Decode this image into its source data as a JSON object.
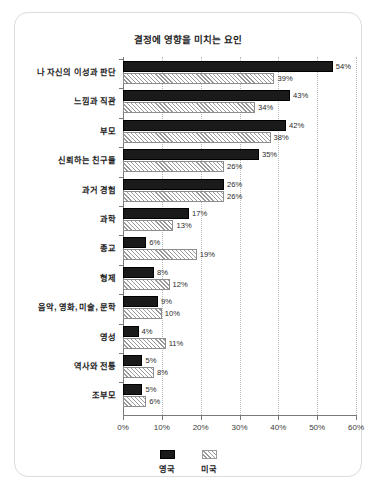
{
  "card": {
    "background_color": "#ffffff",
    "border_color": "#dcdcdc"
  },
  "chart_data": {
    "type": "bar",
    "orientation": "horizontal",
    "title": "결정에 영향을 미치는 요인",
    "xlabel": "",
    "ylabel": "",
    "xlim": [
      0,
      60
    ],
    "xticks": [
      0,
      10,
      20,
      30,
      40,
      50,
      60
    ],
    "xtick_labels": [
      "0%",
      "10%",
      "20%",
      "30%",
      "40%",
      "50%",
      "60%"
    ],
    "grid": true,
    "grid_style": "dotted-vertical",
    "legend_position": "bottom-center",
    "value_label_suffix": "%",
    "categories": [
      "나 자신의 이성과 판단",
      "느낌과 직관",
      "부모",
      "신뢰하는 친구들",
      "과거 경험",
      "과학",
      "종교",
      "형제",
      "음악, 영화, 미술, 문학",
      "영성",
      "역사와 전통",
      "조부모"
    ],
    "series": [
      {
        "name": "영국",
        "color": "#1a1a1a",
        "pattern": "solid",
        "values": [
          54,
          43,
          42,
          35,
          26,
          17,
          6,
          8,
          9,
          4,
          5,
          5
        ],
        "value_labels": [
          "54%",
          "43%",
          "42%",
          "35%",
          "26%",
          "17%",
          "6%",
          "8%",
          "9%",
          "4%",
          "5%",
          "5%"
        ]
      },
      {
        "name": "미국",
        "color": "#ffffff",
        "pattern": "diagonal-hatch",
        "values": [
          39,
          34,
          38,
          26,
          26,
          13,
          19,
          12,
          10,
          11,
          8,
          6
        ],
        "value_labels": [
          "39%",
          "34%",
          "38%",
          "26%",
          "26%",
          "13%",
          "19%",
          "12%",
          "10%",
          "11%",
          "8%",
          "6%"
        ]
      }
    ]
  },
  "legend": {
    "items": [
      {
        "label": "영국",
        "swatch": "solid-black-swatch"
      },
      {
        "label": "미국",
        "swatch": "hatched-swatch"
      }
    ]
  }
}
